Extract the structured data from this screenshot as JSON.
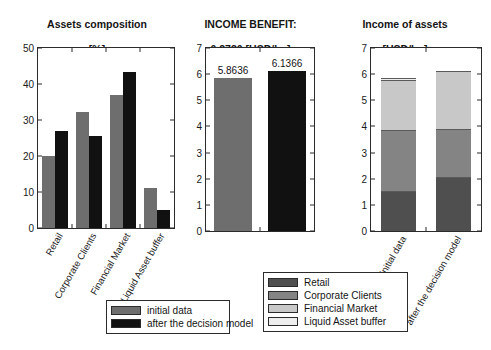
{
  "figure": {
    "width": 491,
    "height": 350,
    "background": "#ffffff"
  },
  "colors": {
    "initial_data": "#6e6e6e",
    "after_decision_model": "#111111",
    "retail": "#4f4f4f",
    "corporate_clients": "#848484",
    "financial_market": "#c8c8c8",
    "liquid_asset_buffer": "#eeeeee",
    "axis": "#2b2b2b",
    "text": "#141414"
  },
  "panels": {
    "assets_composition": {
      "title": "Assets composition\n[%]",
      "title_line1": "Assets composition",
      "title_line2": "[%]"
    },
    "income_benefit": {
      "title_line1": "INCOME BENEFIT:",
      "title_line2": "0.2730 [USD/bn]"
    },
    "income_of_assets": {
      "title_line1": "Income of assets",
      "title_line2": "[USD/bn]"
    }
  },
  "legend_series": {
    "items": [
      {
        "label": "initial data",
        "color": "#6e6e6e"
      },
      {
        "label": "after the decision model",
        "color": "#111111"
      }
    ]
  },
  "legend_assets": {
    "items": [
      {
        "label": "Retail",
        "color": "#4f4f4f"
      },
      {
        "label": "Corporate Clients",
        "color": "#848484"
      },
      {
        "label": "Financial Market",
        "color": "#c8c8c8"
      },
      {
        "label": "Liquid Asset buffer",
        "color": "#eeeeee"
      }
    ]
  },
  "chart_data": [
    {
      "id": "assets-composition",
      "type": "bar",
      "title": "Assets composition [%]",
      "xlabel": "",
      "ylabel": "[%]",
      "ylim": [
        0,
        50
      ],
      "yticks": [
        0,
        10,
        20,
        30,
        40,
        50
      ],
      "grid": false,
      "legend_position": "below-left",
      "categories": [
        "Retail",
        "Corporate Clients",
        "Financial Market",
        "Liquid Asset buffer"
      ],
      "series": [
        {
          "name": "initial data",
          "color": "#6e6e6e",
          "values": [
            20.0,
            32.3,
            37.0,
            11.2
          ]
        },
        {
          "name": "after the decision model",
          "color": "#111111",
          "values": [
            27.0,
            25.5,
            43.2,
            4.9
          ]
        }
      ]
    },
    {
      "id": "income-benefit",
      "type": "bar",
      "title": "INCOME BENEFIT: 0.2730 [USD/bn]",
      "xlabel": "",
      "ylabel": "[USD/bn]",
      "ylim": [
        0,
        7
      ],
      "yticks": [
        0,
        1,
        2,
        3,
        4,
        5,
        6,
        7
      ],
      "grid": false,
      "legend_position": "none",
      "categories": [
        "initial data",
        "after the decision model"
      ],
      "values": [
        5.8636,
        6.1366
      ],
      "data_labels": [
        "5.8636",
        "6.1366"
      ],
      "bar_colors": [
        "#6e6e6e",
        "#111111"
      ],
      "annotation": "0.2730 [USD/bn]"
    },
    {
      "id": "income-of-assets",
      "type": "bar",
      "stacked": true,
      "title": "Income of assets [USD/bn]",
      "xlabel": "",
      "ylabel": "[USD/bn]",
      "ylim": [
        0,
        7
      ],
      "yticks": [
        0,
        1,
        2,
        3,
        4,
        5,
        6,
        7
      ],
      "grid": false,
      "legend_position": "below-left",
      "categories": [
        "initial data",
        "after the decision model"
      ],
      "series": [
        {
          "name": "Retail",
          "color": "#4f4f4f",
          "values": [
            1.52,
            2.05
          ]
        },
        {
          "name": "Corporate Clients",
          "color": "#848484",
          "values": [
            2.36,
            1.85
          ]
        },
        {
          "name": "Financial Market",
          "color": "#c8c8c8",
          "values": [
            1.88,
            2.22
          ]
        },
        {
          "name": "Liquid Asset buffer",
          "color": "#eeeeee",
          "values": [
            0.1,
            0.0
          ]
        }
      ],
      "totals": [
        5.86,
        6.12
      ]
    }
  ],
  "axis_labels": {
    "panel1_yticks": [
      "0",
      "10",
      "20",
      "30",
      "40",
      "50"
    ],
    "panel2_yticks": [
      "0",
      "1",
      "2",
      "3",
      "4",
      "5",
      "6",
      "7"
    ],
    "panel3_yticks": [
      "0",
      "1",
      "2",
      "3",
      "4",
      "5",
      "6",
      "7"
    ],
    "panel1_xticks": [
      "Retail",
      "Corporate Clients",
      "Financial Market",
      "Liquid Asset buffer"
    ],
    "panel3_xticks": [
      "initial data",
      "after the decision model"
    ],
    "panel2_barlabels": [
      "5.8636",
      "6.1366"
    ]
  }
}
